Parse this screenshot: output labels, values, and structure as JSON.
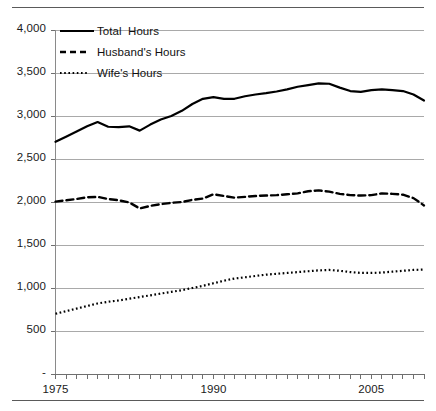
{
  "figure": {
    "name": "annual-work-hours-line-chart",
    "top_rule": true,
    "bottom_rule": true
  },
  "chart_data": {
    "type": "line",
    "title": "",
    "subtitle": "",
    "xlabel": "",
    "ylabel": "",
    "grid": true,
    "legend_position": "top-left",
    "xlim": [
      1975,
      2010
    ],
    "ylim": [
      0,
      4000
    ],
    "y_ticks": [
      0,
      500,
      1000,
      1500,
      2000,
      2500,
      3000,
      3500,
      4000
    ],
    "y_tick_labels": [
      "-",
      "500",
      "1,000",
      "1,500",
      "2,000",
      "2,500",
      "3,000",
      "3,500",
      "4,000"
    ],
    "x_ticks": [
      1975,
      1976,
      1977,
      1978,
      1979,
      1980,
      1981,
      1982,
      1983,
      1984,
      1985,
      1986,
      1987,
      1988,
      1989,
      1990,
      1991,
      1992,
      1993,
      1994,
      1995,
      1996,
      1997,
      1998,
      1999,
      2000,
      2001,
      2002,
      2003,
      2004,
      2005,
      2006,
      2007,
      2008,
      2009,
      2010
    ],
    "x_tick_labels_shown": [
      "1975",
      "1990",
      "2005"
    ],
    "x_tick_labels_shown_at": [
      1975,
      1990,
      2005
    ],
    "x": [
      1975,
      1976,
      1977,
      1978,
      1979,
      1980,
      1981,
      1982,
      1983,
      1984,
      1985,
      1986,
      1987,
      1988,
      1989,
      1990,
      1991,
      1992,
      1993,
      1994,
      1995,
      1996,
      1997,
      1998,
      1999,
      2000,
      2001,
      2002,
      2003,
      2004,
      2005,
      2006,
      2007,
      2008,
      2009,
      2010
    ],
    "series": [
      {
        "name": "Total  Hours",
        "style": "solid",
        "color": "#000000",
        "values": [
          2700,
          2760,
          2820,
          2880,
          2930,
          2875,
          2870,
          2880,
          2830,
          2900,
          2960,
          3000,
          3060,
          3140,
          3200,
          3220,
          3200,
          3200,
          3230,
          3250,
          3265,
          3285,
          3310,
          3340,
          3360,
          3380,
          3375,
          3330,
          3290,
          3280,
          3300,
          3310,
          3300,
          3290,
          3250,
          3180
        ]
      },
      {
        "name": "Husband's Hours",
        "style": "dashed",
        "color": "#000000",
        "values": [
          2005,
          2020,
          2035,
          2055,
          2060,
          2035,
          2020,
          1995,
          1925,
          1955,
          1975,
          1990,
          2000,
          2025,
          2040,
          2090,
          2070,
          2050,
          2060,
          2070,
          2075,
          2080,
          2090,
          2100,
          2125,
          2135,
          2120,
          2095,
          2080,
          2075,
          2080,
          2100,
          2095,
          2085,
          2045,
          1960
        ]
      },
      {
        "name": "Wife's Hours",
        "style": "dotted",
        "color": "#000000",
        "values": [
          700,
          730,
          760,
          790,
          820,
          840,
          855,
          875,
          895,
          915,
          935,
          955,
          975,
          1000,
          1025,
          1055,
          1085,
          1110,
          1125,
          1140,
          1155,
          1165,
          1175,
          1185,
          1195,
          1205,
          1210,
          1200,
          1185,
          1175,
          1175,
          1180,
          1190,
          1200,
          1210,
          1215
        ]
      }
    ]
  },
  "legend": {
    "items": [
      {
        "label": "Total  Hours",
        "style": "solid"
      },
      {
        "label": "Husband's Hours",
        "style": "dashed"
      },
      {
        "label": "Wife's Hours",
        "style": "dotted"
      }
    ]
  }
}
